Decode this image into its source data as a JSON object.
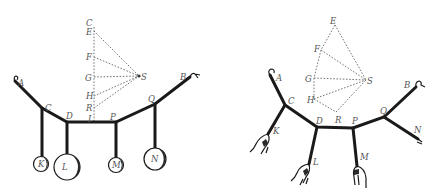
{
  "figures": [
    {
      "id": "left",
      "title": "Funicular with hanging weights",
      "labels": {
        "A": "A",
        "B": "B",
        "C": "C",
        "D": "D",
        "P": "P",
        "Q": "Q",
        "K": "K",
        "L": "L",
        "M": "M",
        "N": "N",
        "C2": "C",
        "E": "E",
        "F": "F",
        "G": "G",
        "H": "H",
        "R": "R",
        "S": "S",
        "I": "I"
      }
    },
    {
      "id": "right",
      "title": "Funicular with hand-applied forces",
      "labels": {
        "A": "A",
        "B": "B",
        "C": "C",
        "D": "D",
        "P": "P",
        "Q": "Q",
        "K": "K",
        "L": "L",
        "M": "M",
        "N": "N",
        "E": "E",
        "F": "F",
        "G": "G",
        "H": "H",
        "R": "R",
        "S": "S"
      }
    }
  ],
  "colors": {
    "ink": "#1a1a1a",
    "dashed": "#666666",
    "label": "#555555",
    "background": "#ffffff"
  }
}
